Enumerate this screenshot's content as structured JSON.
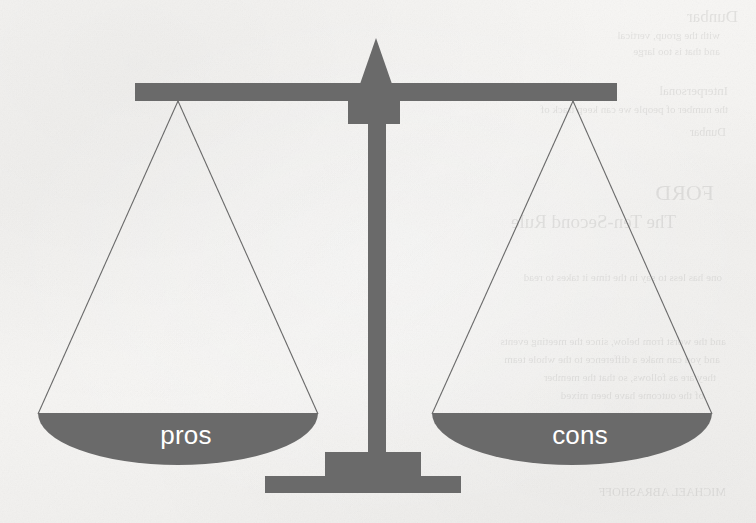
{
  "diagram": {
    "kind": "balance scale weighing pros against cons",
    "state": "balanced",
    "colors": {
      "scale_gray": "#6a6a6a",
      "paper_background": "#f5f4f2",
      "label_text": "#ffffff",
      "hairline": "#6a6a6a"
    },
    "parts": {
      "pointer_arrow": "pointer-arrow",
      "beam": "beam-bar",
      "column_collar": "column-collar",
      "column_shaft": "column-shaft",
      "base_block": "base-block",
      "base_plate": "base-plate"
    },
    "pans": [
      {
        "side": "left",
        "label": "pros"
      },
      {
        "side": "right",
        "label": "cons"
      }
    ]
  },
  "background_bleed": {
    "note": "faint mirrored text bleeding through from the reverse side of the scanned page",
    "lines": [
      {
        "text": "Dunbar",
        "x": 18,
        "y": 8,
        "size": 17
      },
      {
        "text": "with the group, vertical",
        "x": 36,
        "y": 30,
        "size": 11
      },
      {
        "text": "and that is too large",
        "x": 36,
        "y": 46,
        "size": 11
      },
      {
        "text": "Interpersonal",
        "x": 28,
        "y": 84,
        "size": 13
      },
      {
        "text": "the number of people we can keep track of",
        "x": 28,
        "y": 104,
        "size": 11
      },
      {
        "text": "Dunbar",
        "x": 30,
        "y": 126,
        "size": 12
      },
      {
        "text": "FORD",
        "x": 42,
        "y": 182,
        "size": 22
      },
      {
        "text": "The Ten-Second Rule",
        "x": 80,
        "y": 212,
        "size": 19
      },
      {
        "text": "one has less to say in the time it takes to read",
        "x": 34,
        "y": 272,
        "size": 11
      },
      {
        "text": "and the worst from below, since the meeting events",
        "x": 30,
        "y": 336,
        "size": 11
      },
      {
        "text": "and you can make a difference to the whole team",
        "x": 36,
        "y": 354,
        "size": 11
      },
      {
        "text": "they are as follows, so that the member",
        "x": 40,
        "y": 372,
        "size": 11
      },
      {
        "text": "of the outcome have been mixed",
        "x": 52,
        "y": 390,
        "size": 11
      },
      {
        "text": "MICHAEL ABRASHOFF",
        "x": 30,
        "y": 486,
        "size": 12
      }
    ]
  }
}
